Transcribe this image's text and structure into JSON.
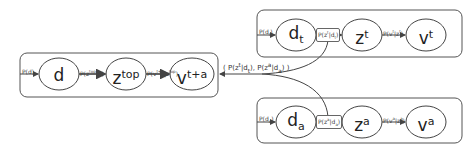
{
  "diagram": {
    "type": "graphical-model",
    "plates": [
      {
        "id": "combined",
        "nodes": [
          {
            "id": "d",
            "base": "d",
            "sup": "",
            "sub": ""
          },
          {
            "id": "z_top",
            "base": "z",
            "sup": "top",
            "sub": ""
          },
          {
            "id": "v_ta",
            "base": "v",
            "sup": "t+a",
            "sub": ""
          }
        ],
        "edge_labels": [
          "P(d)",
          "P(z top|d)",
          "P(v t+a|z top)"
        ]
      },
      {
        "id": "text",
        "nodes": [
          {
            "id": "d_t",
            "base": "d",
            "sup": "",
            "sub": "t"
          },
          {
            "id": "z_t",
            "base": "z",
            "sup": "t",
            "sub": ""
          },
          {
            "id": "v_t",
            "base": "v",
            "sup": "t",
            "sub": ""
          }
        ],
        "edge_labels": [
          "P(dt)",
          "P(zt|dt)",
          "P(vt|zt)"
        ]
      },
      {
        "id": "audio",
        "nodes": [
          {
            "id": "d_a",
            "base": "d",
            "sup": "",
            "sub": "a"
          },
          {
            "id": "z_a",
            "base": "z",
            "sup": "a",
            "sub": ""
          },
          {
            "id": "v_a",
            "base": "v",
            "sup": "a",
            "sub": ""
          }
        ],
        "edge_labels": [
          "P(da)",
          "P(za|da)",
          "P(va|za)"
        ]
      }
    ],
    "merge_label": "( P(zt|dt), P(za|da) )"
  }
}
